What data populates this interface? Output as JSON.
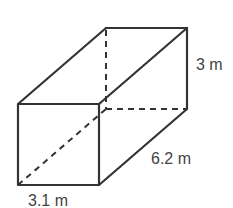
{
  "figure": {
    "type": "rectangular-prism",
    "labels": {
      "height": "3 m",
      "depth": "6.2 m",
      "width": "3.1 m"
    },
    "colors": {
      "line": "#333333",
      "text": "#444444",
      "background": "#ffffff"
    }
  }
}
